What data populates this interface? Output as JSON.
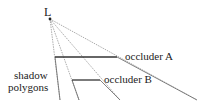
{
  "diagram": {
    "light_label": "L",
    "occluder_a_label": "occluder A",
    "occluder_b_label": "occluder B",
    "shadow_label_line1": "shadow",
    "shadow_label_line2": "polygons",
    "colors": {
      "line": "#333333",
      "ray": "#888888",
      "text": "#222222"
    }
  }
}
